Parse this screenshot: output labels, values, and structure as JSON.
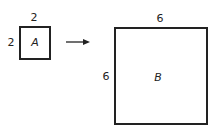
{
  "square_a": {
    "name": "A",
    "top_label": "2",
    "left_label": "2"
  },
  "square_b": {
    "name": "B",
    "top_label": "6",
    "left_label": "6"
  },
  "arrow": {
    "direction": "right"
  }
}
